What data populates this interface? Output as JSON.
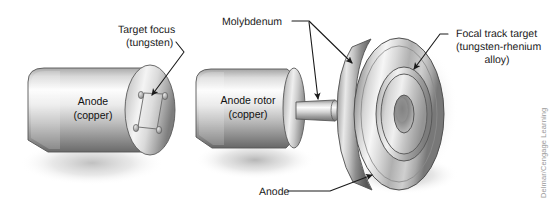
{
  "figure": {
    "background_color": "#ffffff",
    "credit": "Delmar/Cengage Learning"
  },
  "labels": {
    "target_focus_line1": "Target focus",
    "target_focus_line2": "(tungsten)",
    "anode_stationary_line1": "Anode",
    "anode_stationary_line2": "(copper)",
    "molybdenum": "Molybdenum",
    "anode_rotor_line1": "Anode rotor",
    "anode_rotor_line2": "(copper)",
    "focal_track_line1": "Focal track target",
    "focal_track_line2": "(tungsten-rhenium",
    "focal_track_line3": "alloy)",
    "anode_disc": "Anode"
  },
  "colors": {
    "metal_light": "#fbfbfb",
    "metal_mid": "#b9b9b9",
    "metal_dark": "#6f6f6f",
    "metal_darkest": "#4d4d4d",
    "text": "#1a1a1a",
    "credit_text": "#9a9a9a",
    "leader_line": "#1a1a1a",
    "shadow": "#cfcfcf"
  },
  "parts": {
    "stationary_anode": {
      "name": "Stationary anode block",
      "material": "copper",
      "insert_material": "tungsten",
      "screw_count": 4
    },
    "rotating_anode": {
      "name": "Rotating anode assembly",
      "rotor_material": "copper",
      "stem_material": "molybdenum",
      "disc_body_material": "molybdenum",
      "focal_track_material": "tungsten-rhenium alloy"
    }
  }
}
